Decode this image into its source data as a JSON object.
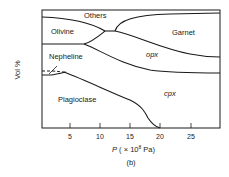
{
  "figure": {
    "panel_label": "(b)",
    "y_axis_label": "Vol %",
    "x_axis_label_prefix": "P",
    "x_axis_label_suffix": " ( × 10",
    "x_axis_exponent": "8",
    "x_axis_unit": " Pa)",
    "x_ticks": [
      "5",
      "10",
      "15",
      "20",
      "25"
    ],
    "regions": {
      "others": "Others",
      "olivine": "Olivine",
      "garnet": "Garnet",
      "nepheline": "Nepheline",
      "opx": "opx",
      "cpx": "cpx",
      "plagioclase": "Plagioclase"
    },
    "line_color": "#1a1a1a"
  },
  "diagram_data": {
    "type": "stacked-phase-diagram",
    "x_axis": {
      "label": "P (× 10^8 Pa)",
      "range": [
        0,
        30
      ],
      "ticks": [
        5,
        10,
        15,
        20,
        25
      ]
    },
    "y_axis": {
      "label": "Vol %"
    },
    "phases_bottom_to_top": [
      "Plagioclase",
      "Nepheline",
      "cpx",
      "opx",
      "Olivine",
      "Garnet",
      "Others"
    ]
  }
}
